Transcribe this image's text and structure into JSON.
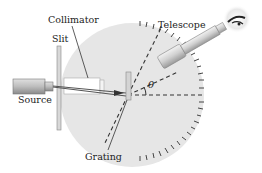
{
  "diagram": {
    "labels": {
      "collimator": "Collimator",
      "slit": "Slit",
      "telescope": "Telescope",
      "source": "Source",
      "grating": "Grating",
      "angle": "θ"
    },
    "colors": {
      "table": "#e6e6e6",
      "tube": "#cfcfcf",
      "ink": "#333333",
      "background": "#ffffff"
    }
  }
}
